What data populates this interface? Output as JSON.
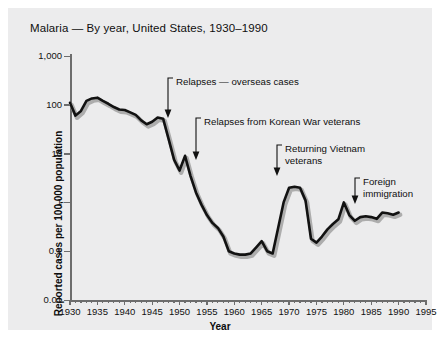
{
  "chart_data": {
    "type": "line",
    "title": "Malaria — By year, United States, 1930–1990",
    "xlabel": "Year",
    "ylabel": "Reported cases per 100,000 population",
    "yscale": "log",
    "ylim": [
      0.01,
      1000
    ],
    "xlim": [
      1930,
      1995
    ],
    "ytick_labels": [
      "1,000",
      "100",
      "10",
      "1",
      "0.1",
      "0.01"
    ],
    "ytick_values": [
      1000,
      100,
      10,
      1,
      0.1,
      0.01
    ],
    "xtick_labels": [
      "1930",
      "1935",
      "1940",
      "1945",
      "1950",
      "1955",
      "1960",
      "1965",
      "1970",
      "1975",
      "1980",
      "1985",
      "1990",
      "1995"
    ],
    "xtick_values": [
      1930,
      1935,
      1940,
      1945,
      1950,
      1955,
      1960,
      1965,
      1970,
      1975,
      1980,
      1985,
      1990,
      1995
    ],
    "grid": false,
    "legend": "none",
    "series": [
      {
        "name": "Reported malaria cases per 100,000 population",
        "x": [
          1930,
          1931,
          1932,
          1933,
          1934,
          1935,
          1936,
          1937,
          1938,
          1939,
          1940,
          1941,
          1942,
          1943,
          1944,
          1945,
          1946,
          1947,
          1948,
          1949,
          1950,
          1951,
          1952,
          1953,
          1954,
          1955,
          1956,
          1957,
          1958,
          1959,
          1960,
          1961,
          1962,
          1963,
          1964,
          1965,
          1966,
          1967,
          1968,
          1969,
          1970,
          1971,
          1972,
          1973,
          1974,
          1975,
          1976,
          1977,
          1978,
          1979,
          1980,
          1981,
          1982,
          1983,
          1984,
          1985,
          1986,
          1987,
          1988,
          1989,
          1990
        ],
        "values": [
          110,
          60,
          75,
          120,
          135,
          140,
          120,
          105,
          90,
          80,
          78,
          70,
          62,
          48,
          40,
          45,
          55,
          52,
          20,
          7.5,
          4.5,
          9,
          3.5,
          1.6,
          0.9,
          0.55,
          0.38,
          0.3,
          0.2,
          0.1,
          0.09,
          0.085,
          0.085,
          0.09,
          0.12,
          0.16,
          0.1,
          0.09,
          0.3,
          1.0,
          2.0,
          2.1,
          2.0,
          1.1,
          0.18,
          0.15,
          0.2,
          0.28,
          0.36,
          0.45,
          1.0,
          0.55,
          0.42,
          0.5,
          0.52,
          0.5,
          0.46,
          0.62,
          0.6,
          0.56,
          0.62
        ]
      }
    ],
    "annotations": [
      {
        "id": "relapses-overseas",
        "text": "Relapses — overseas cases",
        "target_year": 1947,
        "target_value": 52
      },
      {
        "id": "relapses-korean-war",
        "text": "Relapses from Korean War veterans",
        "target_year": 1951,
        "target_value": 9
      },
      {
        "id": "returning-vietnam-veterans",
        "line1": "Returning Vietnam",
        "line2": "veterans",
        "target_year": 1970,
        "target_value": 2.0
      },
      {
        "id": "foreign-immigration",
        "line1": "Foreign",
        "line2": "immigration",
        "target_year": 1980,
        "target_value": 1.0
      }
    ]
  }
}
